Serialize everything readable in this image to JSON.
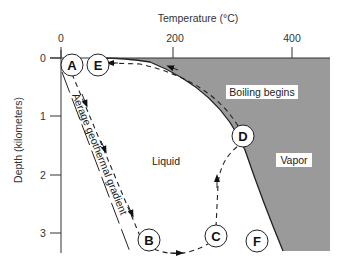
{
  "diagram": {
    "x_axis": {
      "title": "Temperature (°C)",
      "ticks": [
        "0",
        "200",
        "400"
      ]
    },
    "y_axis": {
      "title": "Depth (kilometers)",
      "ticks": [
        "0",
        "1",
        "2",
        "3"
      ]
    },
    "regions": {
      "liquid": "Liquid",
      "vapor": "Vapor"
    },
    "annotations": {
      "boiling": "Boiling begins",
      "gradient": "Aerage geothermal gradient"
    },
    "points": {
      "A": "A",
      "B": "B",
      "C": "C",
      "D": "D",
      "E": "E",
      "F": "F"
    },
    "colors": {
      "vapor_fill": "#9a9a9a",
      "line": "#222222",
      "background": "#ffffff"
    }
  }
}
